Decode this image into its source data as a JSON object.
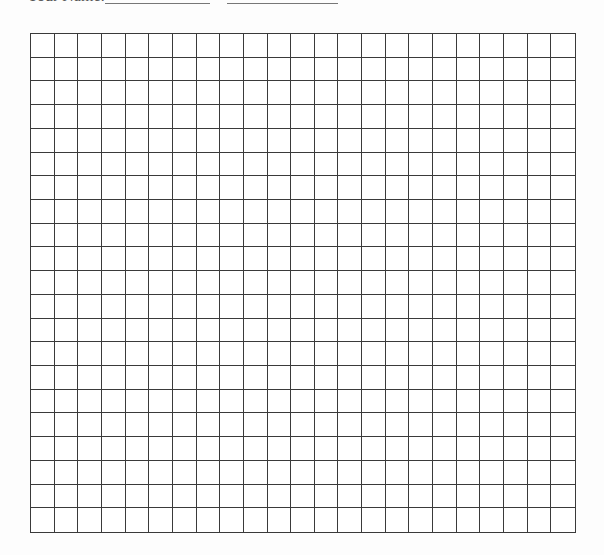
{
  "header": {
    "label": "Your Name:",
    "blanks": [
      {
        "left": 105,
        "width": 105
      },
      {
        "left": 227,
        "width": 111
      }
    ]
  },
  "grid": {
    "columns": 23,
    "rows": 21,
    "line_color": "#3a3a3a"
  }
}
